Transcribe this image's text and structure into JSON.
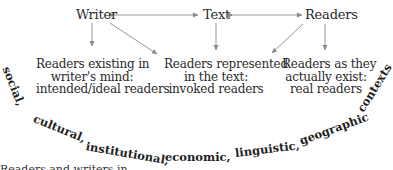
{
  "diagram": {
    "top_row": {
      "writer": "Writer",
      "text": "Text",
      "readers": "Readers"
    },
    "boxes": {
      "intended": {
        "line1": "Readers existing in",
        "line2": "writer's mind:",
        "line3": "intended/ideal readers"
      },
      "invoked": {
        "line1": "Readers represented",
        "line2": "in the text:",
        "line3": "invoked readers"
      },
      "real": {
        "line1": "Readers as they",
        "line2": "actually exist:",
        "line3": "real readers"
      }
    },
    "arc_words": [
      "social,",
      "cultural,",
      "institutional,",
      "economic,",
      "linguistic,",
      "geographic",
      "contexts"
    ],
    "clipped_caption": "Readers and writers in"
  },
  "colors": {
    "text": "#2a2a2a",
    "arrow": "#8a8a8a",
    "background": "#ffffff"
  }
}
